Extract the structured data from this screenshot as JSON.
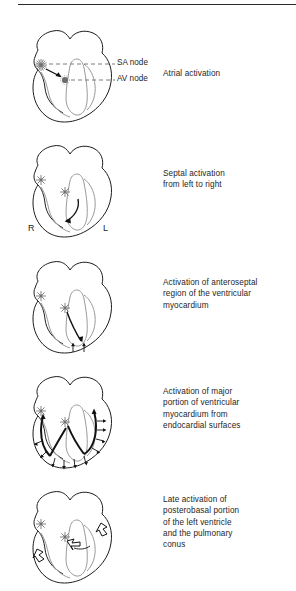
{
  "figure": {
    "divider": "top-rule"
  },
  "panels": [
    {
      "id": "panel-atrial",
      "caption": "Atrial activation",
      "caption_lines": [
        "Atrial activation"
      ],
      "leaders": [
        {
          "label": "SA node",
          "target": "sa-node"
        },
        {
          "label": "AV node",
          "target": "av-node"
        }
      ],
      "markers": [
        {
          "name": "sa-node",
          "kind": "starburst"
        },
        {
          "name": "av-node",
          "kind": "dotted-circle"
        }
      ],
      "arrows": [
        {
          "name": "sa-to-av-arrow",
          "kind": "solid-arrow"
        }
      ],
      "side_labels": []
    },
    {
      "id": "panel-septal",
      "caption": "Septal activation from left to right",
      "caption_lines": [
        "Septal activation",
        "from left to right"
      ],
      "leaders": [],
      "markers": [
        {
          "name": "sa-node",
          "kind": "starburst"
        },
        {
          "name": "av-node",
          "kind": "starburst"
        }
      ],
      "arrows": [
        {
          "name": "septal-curved-arrow",
          "kind": "curved-arrow"
        }
      ],
      "side_labels": [
        {
          "name": "right-side-label",
          "text": "R"
        },
        {
          "name": "left-side-label",
          "text": "L"
        }
      ]
    },
    {
      "id": "panel-anteroseptal",
      "caption": "Activation of anteroseptal region of the ventricular myocardium",
      "caption_lines": [
        "Activation of anteroseptal",
        "region of the ventricular",
        "myocardium"
      ],
      "leaders": [],
      "markers": [
        {
          "name": "sa-node",
          "kind": "starburst"
        },
        {
          "name": "av-node",
          "kind": "starburst"
        }
      ],
      "arrows": [
        {
          "name": "anteroseptal-main-arrow",
          "kind": "solid-arrow"
        },
        {
          "name": "apex-arrow-left",
          "kind": "small-arrow"
        },
        {
          "name": "apex-arrow-right",
          "kind": "small-arrow"
        }
      ],
      "side_labels": []
    },
    {
      "id": "panel-major-portion",
      "caption": "Activation of major portion of ventricular myocardium from endocardial surfaces",
      "caption_lines": [
        "Activation of major",
        "portion of ventricular",
        "myocardium from",
        "endocardial surfaces"
      ],
      "leaders": [],
      "markers": [
        {
          "name": "sa-node",
          "kind": "starburst"
        },
        {
          "name": "av-node",
          "kind": "starburst"
        }
      ],
      "arrows": [
        {
          "name": "purkinje-right-branch",
          "kind": "thick-path-arrow"
        },
        {
          "name": "purkinje-left-branch",
          "kind": "thick-path-arrow"
        },
        {
          "name": "endocardial-arrow-array",
          "kind": "small-arrow-array"
        }
      ],
      "side_labels": []
    },
    {
      "id": "panel-late-activation",
      "caption": "Late activation of posterobasal portion of the left ventricle and the pulmonary conus",
      "caption_lines": [
        "Late activation of",
        "posterobasal portion",
        "of the left ventricle",
        "and the pulmonary",
        "conus"
      ],
      "leaders": [],
      "markers": [
        {
          "name": "sa-node",
          "kind": "starburst"
        },
        {
          "name": "av-node",
          "kind": "starburst"
        }
      ],
      "arrows": [
        {
          "name": "pulmonary-conus-arrow",
          "kind": "hollow-arrow"
        },
        {
          "name": "posterobasal-arrow",
          "kind": "hollow-arrow"
        },
        {
          "name": "septal-base-arrow",
          "kind": "hollow-arrow"
        }
      ],
      "side_labels": []
    }
  ],
  "colors": {
    "outline": "#1d1d1d",
    "inner_chamber": "#9a9a9a",
    "node_marker": "#6f6f6f",
    "leader_line": "#6d6d6d",
    "text": "#1e1e1e",
    "background": "#ffffff"
  }
}
